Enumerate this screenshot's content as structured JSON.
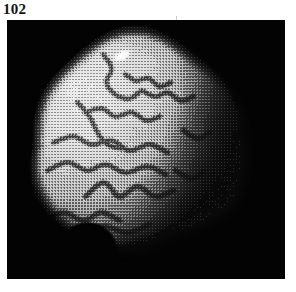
{
  "figure": {
    "number_label": "102",
    "plate": {
      "background_color": "#030303",
      "frame": {
        "x": 7,
        "y": 20,
        "width": 278,
        "height": 259
      },
      "media": "halftone-screened black-and-white photographic plate",
      "subject": "spherical specimen with branching surface grooves",
      "lighting": "illuminated from upper-left, terminator shading to black at right"
    },
    "specimen": {
      "shape": "sphere",
      "center_x": 133,
      "center_y": 125,
      "radius": 113,
      "notch": {
        "description": "concave bite out of lower-left limb",
        "center_x": 80,
        "center_y": 232,
        "radius": 30
      },
      "highlight": {
        "description": "bright specular spot near upper-left",
        "center_x": 115,
        "center_y": 35,
        "radius_x": 13,
        "radius_y": 7,
        "angle_deg": -28
      },
      "surface_tone": {
        "lit": "#d8d8d8",
        "mid": "#9a9a9a",
        "shadow": "#121212",
        "limb": "#050505"
      },
      "grooves": [
        {
          "name": "groove-upper-arc",
          "points": [
            [
              96,
              34
            ],
            [
              104,
              48
            ],
            [
              99,
              62
            ],
            [
              108,
              74
            ],
            [
              122,
              78
            ],
            [
              134,
              70
            ]
          ]
        },
        {
          "name": "groove-crown-branch",
          "points": [
            [
              118,
              54
            ],
            [
              128,
              60
            ],
            [
              141,
              58
            ],
            [
              152,
              66
            ],
            [
              163,
              62
            ]
          ]
        },
        {
          "name": "groove-upper-right-fork",
          "points": [
            [
              134,
              70
            ],
            [
              148,
              76
            ],
            [
              160,
              72
            ],
            [
              173,
              80
            ],
            [
              186,
              76
            ]
          ]
        },
        {
          "name": "groove-mid-upper",
          "points": [
            [
              78,
              92
            ],
            [
              94,
              88
            ],
            [
              108,
              96
            ],
            [
              124,
              92
            ],
            [
              139,
              100
            ],
            [
              152,
              96
            ]
          ]
        },
        {
          "name": "groove-mid-left-descend",
          "points": [
            [
              70,
              82
            ],
            [
              82,
              96
            ],
            [
              90,
              112
            ],
            [
              100,
              124
            ],
            [
              114,
              128
            ]
          ]
        },
        {
          "name": "groove-mid-band",
          "points": [
            [
              46,
              122
            ],
            [
              66,
              116
            ],
            [
              84,
              124
            ],
            [
              104,
              120
            ],
            [
              122,
              130
            ],
            [
              142,
              124
            ],
            [
              160,
              132
            ]
          ]
        },
        {
          "name": "groove-mid-lower-band",
          "points": [
            [
              40,
              150
            ],
            [
              60,
              142
            ],
            [
              80,
              150
            ],
            [
              98,
              144
            ],
            [
              118,
              152
            ],
            [
              140,
              146
            ],
            [
              158,
              154
            ]
          ]
        },
        {
          "name": "groove-lower-v",
          "points": [
            [
              78,
              176
            ],
            [
              96,
              162
            ],
            [
              112,
              176
            ],
            [
              130,
              166
            ],
            [
              148,
              176
            ],
            [
              166,
              170
            ]
          ]
        },
        {
          "name": "groove-bottom-left",
          "points": [
            [
              36,
              200
            ],
            [
              56,
              192
            ],
            [
              76,
              200
            ],
            [
              94,
              192
            ],
            [
              112,
              200
            ]
          ]
        },
        {
          "name": "groove-bottom-sweep",
          "points": [
            [
              46,
              208
            ],
            [
              70,
              214
            ],
            [
              96,
              206
            ],
            [
              120,
              212
            ],
            [
              142,
              204
            ]
          ]
        },
        {
          "name": "groove-right-short",
          "points": [
            [
              176,
              110
            ],
            [
              190,
              118
            ],
            [
              202,
              112
            ]
          ]
        },
        {
          "name": "groove-right-lower",
          "points": [
            [
              168,
              150
            ],
            [
              184,
              158
            ],
            [
              196,
              152
            ]
          ]
        }
      ]
    }
  }
}
